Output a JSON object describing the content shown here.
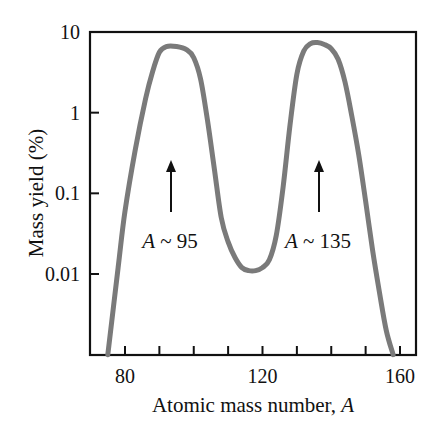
{
  "chart_data": {
    "type": "line",
    "title": "",
    "xlabel": "Atomic mass number, A",
    "xlabel_plain": "Atomic mass number, ",
    "xlabel_italic": "A",
    "ylabel": "Mass yield (%)",
    "yscale": "log",
    "xlim": [
      70,
      165
    ],
    "ylim": [
      0.001,
      10
    ],
    "xticks": [
      80,
      90,
      100,
      110,
      120,
      130,
      140,
      150,
      160
    ],
    "xtick_labels": [
      "80",
      "120",
      "160"
    ],
    "xtick_label_values": [
      80,
      120,
      160
    ],
    "yticks": [
      10,
      1,
      0.1,
      0.01
    ],
    "ytick_labels": [
      "10",
      "1",
      "0.1",
      "0.01"
    ],
    "grid": false,
    "legend": null,
    "series": [
      {
        "name": "Fission mass yield",
        "color": "#7a7a7a",
        "x": [
          75,
          78,
          80,
          83,
          86,
          88,
          90,
          92,
          95,
          98,
          100,
          102,
          104,
          106,
          108,
          110,
          112,
          114,
          116,
          118,
          120,
          122,
          124,
          126,
          128,
          130,
          132,
          134,
          136,
          138,
          140,
          142,
          144,
          146,
          148,
          150,
          152,
          154,
          156,
          158
        ],
        "y": [
          0.001,
          0.012,
          0.06,
          0.35,
          1.5,
          3.2,
          5.6,
          6.6,
          6.6,
          6.0,
          4.8,
          2.6,
          0.8,
          0.2,
          0.05,
          0.025,
          0.016,
          0.012,
          0.011,
          0.011,
          0.012,
          0.015,
          0.03,
          0.12,
          0.7,
          3.0,
          5.8,
          7.2,
          7.4,
          7.0,
          6.2,
          4.6,
          2.4,
          0.9,
          0.3,
          0.08,
          0.02,
          0.006,
          0.002,
          0.001
        ]
      }
    ],
    "annotations": [
      {
        "text": "A ~ 95",
        "italic_part": "A",
        "rest": " ~ 95",
        "arrow_x": 95,
        "arrow_from_y": 0.1,
        "arrow_to_y": 0.6
      },
      {
        "text": "A ~ 135",
        "italic_part": "A",
        "rest": " ~ 135",
        "arrow_x": 135,
        "arrow_from_y": 0.1,
        "arrow_to_y": 0.6
      }
    ]
  }
}
